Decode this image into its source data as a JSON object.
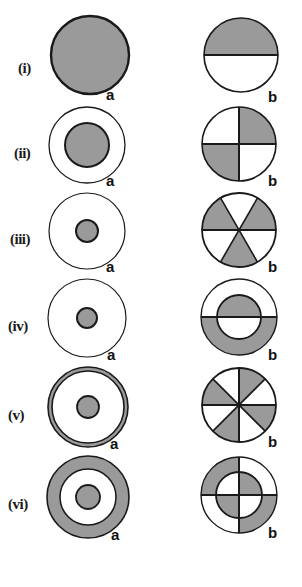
{
  "figure": {
    "title": "",
    "width": 302,
    "height": 587,
    "background": "#ffffff",
    "shade_color": "#9a9a9a",
    "line_color": "#1a1a1a",
    "column_labels": {
      "left": "a",
      "right": "b"
    },
    "rows": [
      {
        "numeral": "(i)",
        "left": {
          "label": "a",
          "description": "full disc shaded",
          "outer_radius": 40,
          "parts": [
            "whole-disc-shaded"
          ]
        },
        "right": {
          "label": "b",
          "description": "disc split horizontally, upper half shaded",
          "outer_radius": 38,
          "parts": [
            "upper-half-shaded",
            "lower-half-white"
          ]
        }
      },
      {
        "numeral": "(ii)",
        "left": {
          "label": "a",
          "description": "outer circle white with large concentric inner disc shaded",
          "outer_radius": 38,
          "inner_radius": 22,
          "parts": [
            "annulus-white",
            "inner-disc-shaded"
          ]
        },
        "right": {
          "label": "b",
          "description": "disc quartered, top-right and bottom-left shaded",
          "outer_radius": 37,
          "parts": [
            "quadrant-tr-shaded",
            "quadrant-bl-shaded",
            "quadrant-tl-white",
            "quadrant-br-white"
          ]
        }
      },
      {
        "numeral": "(iii)",
        "left": {
          "label": "a",
          "description": "outer circle white with small concentric inner disc shaded",
          "outer_radius": 38,
          "inner_radius": 11,
          "parts": [
            "annulus-white",
            "inner-disc-shaded"
          ]
        },
        "right": {
          "label": "b",
          "description": "disc divided into six sectors, alternating shaded",
          "outer_radius": 37,
          "sectors": 6,
          "parts": [
            "sector-1-shaded",
            "sector-2-white",
            "sector-3-shaded",
            "sector-4-white",
            "sector-5-shaded",
            "sector-6-white"
          ]
        }
      },
      {
        "numeral": "(iv)",
        "left": {
          "label": "a",
          "description": "outer circle white with small concentric inner disc shaded",
          "outer_radius": 38,
          "inner_radius": 10,
          "parts": [
            "annulus-white",
            "inner-disc-shaded"
          ]
        },
        "right": {
          "label": "b",
          "description": "concentric circles split horizontally, upper inner disc and lower annulus shaded",
          "outer_radius": 38,
          "inner_radius": 22,
          "parts": [
            "upper-annulus-white",
            "upper-inner-shaded",
            "lower-annulus-shaded",
            "lower-inner-white"
          ]
        }
      },
      {
        "numeral": "(v)",
        "left": {
          "label": "a",
          "description": "thin shaded outer ring with small shaded inner disc",
          "outer_radius": 40,
          "ring_width": 4,
          "inner_radius": 11,
          "parts": [
            "thin-outer-ring-shaded",
            "middle-annulus-white",
            "inner-disc-shaded"
          ]
        },
        "right": {
          "label": "b",
          "description": "disc divided into eight sectors, alternating shaded",
          "outer_radius": 37,
          "sectors": 8,
          "parts": [
            "sector-1-shaded",
            "sector-2-white",
            "sector-3-shaded",
            "sector-4-white",
            "sector-5-shaded",
            "sector-6-white",
            "sector-7-shaded",
            "sector-8-white"
          ]
        }
      },
      {
        "numeral": "(vi)",
        "left": {
          "label": "a",
          "description": "thick shaded outer annulus, white middle annulus, small shaded inner disc",
          "outer_radius": 41,
          "middle_radius": 28,
          "inner_radius": 12,
          "parts": [
            "outer-annulus-shaded",
            "middle-annulus-white",
            "inner-disc-shaded"
          ]
        },
        "right": {
          "label": "b",
          "description": "concentric circles quartered, outer top-left and bottom-right shaded, inner top-right and bottom-left shaded",
          "outer_radius": 38,
          "inner_radius": 23,
          "parts": [
            "outer-tl-shaded",
            "outer-br-shaded",
            "outer-tr-white",
            "outer-bl-white",
            "inner-tr-shaded",
            "inner-bl-shaded",
            "inner-tl-white",
            "inner-br-white"
          ]
        }
      }
    ]
  }
}
